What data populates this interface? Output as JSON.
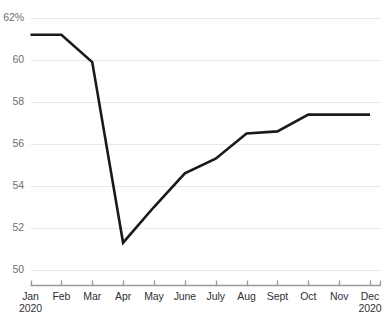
{
  "chart_data": {
    "type": "line",
    "title": "",
    "subtitle": "",
    "xlabel": "",
    "ylabel": "",
    "categories": [
      "Jan",
      "Feb",
      "Mar",
      "Apr",
      "May",
      "June",
      "July",
      "Aug",
      "Sept",
      "Oct",
      "Nov",
      "Dec"
    ],
    "x_tick_labels": [
      {
        "label": "Jan",
        "sub": "2020"
      },
      {
        "label": "Feb",
        "sub": ""
      },
      {
        "label": "Mar",
        "sub": ""
      },
      {
        "label": "Apr",
        "sub": ""
      },
      {
        "label": "May",
        "sub": ""
      },
      {
        "label": "June",
        "sub": ""
      },
      {
        "label": "July",
        "sub": ""
      },
      {
        "label": "Aug",
        "sub": ""
      },
      {
        "label": "Sept",
        "sub": ""
      },
      {
        "label": "Oct",
        "sub": ""
      },
      {
        "label": "Nov",
        "sub": ""
      },
      {
        "label": "Dec",
        "sub": "2020"
      }
    ],
    "y_tick_labels": [
      "62%",
      "60",
      "58",
      "56",
      "54",
      "52",
      "50"
    ],
    "y_ticks": [
      62,
      60,
      58,
      56,
      54,
      52,
      50
    ],
    "ylim": [
      50,
      62
    ],
    "xlim": [
      0,
      11
    ],
    "grid": true,
    "grid_axis": "y",
    "legend": false,
    "legend_position": "none",
    "markers": false,
    "series": [
      {
        "name": "",
        "values": [
          61.2,
          61.2,
          59.9,
          51.3,
          53.0,
          54.6,
          55.3,
          56.5,
          56.6,
          57.4,
          57.4,
          57.4
        ]
      }
    ],
    "colors": {
      "line": "#1a1a1a",
      "grid": "#e8e8e8",
      "axis": "#9a9a9a",
      "tick_text": "#2f3033",
      "ytick_text": "#6d6f71",
      "background": "#ffffff"
    },
    "line_width": 2.6,
    "caption_fragment": ""
  }
}
